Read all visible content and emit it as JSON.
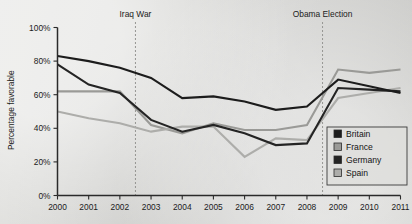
{
  "chart_data": {
    "type": "line",
    "title": "",
    "xlabel": "",
    "ylabel": "Percentage favorable",
    "x": [
      2000,
      2001,
      2002,
      2003,
      2004,
      2005,
      2006,
      2007,
      2008,
      2009,
      2010,
      2011
    ],
    "xtick_labels": [
      "2000",
      "2001",
      "2002",
      "2003",
      "2004",
      "2005",
      "2006",
      "2007",
      "2008",
      "2009",
      "2010",
      "2011"
    ],
    "ytick_labels": [
      "0%",
      "20%",
      "40%",
      "60%",
      "80%",
      "100%"
    ],
    "ytick_values": [
      0,
      20,
      40,
      60,
      80,
      100
    ],
    "xlim": [
      2000,
      2011
    ],
    "ylim": [
      0,
      100
    ],
    "grid": false,
    "legend_position": "lower right",
    "series": [
      {
        "name": "Britain",
        "color": "#1c1c1c",
        "width": 2.1,
        "values": [
          83,
          80,
          76,
          70,
          58,
          59,
          56,
          51,
          53,
          69,
          65,
          61
        ]
      },
      {
        "name": "France",
        "color": "#9a9a97",
        "width": 2.1,
        "values": [
          62,
          62,
          62,
          42,
          37,
          43,
          39,
          39,
          42,
          75,
          73,
          75
        ]
      },
      {
        "name": "Germany",
        "color": "#242424",
        "width": 2.1,
        "values": [
          78,
          66,
          61,
          45,
          38,
          42,
          37,
          30,
          31,
          64,
          63,
          62
        ]
      },
      {
        "name": "Spain",
        "color": "#adadaa",
        "width": 2.1,
        "values": [
          50,
          46,
          43,
          38,
          41,
          41,
          23,
          34,
          33,
          58,
          61,
          64
        ]
      }
    ],
    "annotations": [
      {
        "label": "Iraq War",
        "x": 2002.5
      },
      {
        "label": "Obama Election",
        "x": 2008.5
      }
    ]
  },
  "legend": {
    "items": [
      {
        "label": "Britain",
        "color": "#1c1c1c"
      },
      {
        "label": "France",
        "color": "#9a9a97"
      },
      {
        "label": "Germany",
        "color": "#242424"
      },
      {
        "label": "Spain",
        "color": "#adadaa"
      }
    ]
  }
}
